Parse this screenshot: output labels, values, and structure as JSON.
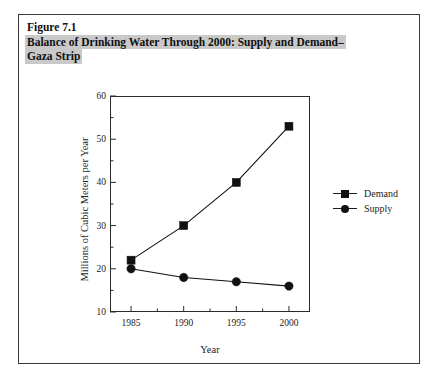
{
  "figure": {
    "caption_lines": [
      {
        "text": "Figure 7.1",
        "highlighted": false
      },
      {
        "text": "Balance of Drinking Water Through 2000: Supply and Demand–",
        "highlighted": true
      },
      {
        "text": "Gaza Strip",
        "highlighted": true
      }
    ]
  },
  "chart_data": {
    "type": "line",
    "xlabel": "Year",
    "ylabel": "Millions of Cubic Meters per Year",
    "x": [
      1985,
      1990,
      1995,
      2000
    ],
    "xlim": [
      1983,
      2002
    ],
    "ylim": [
      10,
      60
    ],
    "xticks": [
      1985,
      1990,
      1995,
      2000
    ],
    "xtick_labels": [
      "1985",
      "1990",
      "1995",
      "2000"
    ],
    "yticks": [
      10,
      20,
      30,
      40,
      50,
      60
    ],
    "ytick_labels": [
      "10",
      "20",
      "30",
      "40",
      "50",
      "60"
    ],
    "y_minor_ticks": [
      15,
      25,
      35,
      45,
      55
    ],
    "x_minor_ticks": [
      1987.5,
      1992.5,
      1997.5
    ],
    "grid": false,
    "legend_position": "right-outside",
    "series": [
      {
        "name": "Demand",
        "marker": "square",
        "color": "#111111",
        "values": [
          22,
          30,
          40,
          53
        ]
      },
      {
        "name": "Supply",
        "marker": "circle",
        "color": "#111111",
        "values": [
          20,
          18,
          17,
          16
        ]
      }
    ]
  },
  "legend": {
    "entries": [
      {
        "label": "Demand",
        "marker": "square"
      },
      {
        "label": "Supply",
        "marker": "circle"
      }
    ]
  }
}
